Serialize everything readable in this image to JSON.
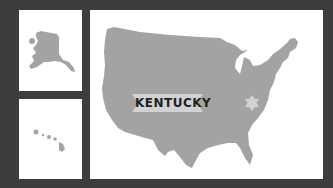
{
  "map": {
    "highlighted_state": "KENTUCKY",
    "insets": [
      "Alaska",
      "Hawaii"
    ],
    "colors": {
      "background": "#3d3d3d",
      "panel": "#ffffff",
      "land": "#a3a3a3",
      "banner": "#d2d2d2",
      "star": "#d2d2d2",
      "text": "#222222"
    }
  }
}
